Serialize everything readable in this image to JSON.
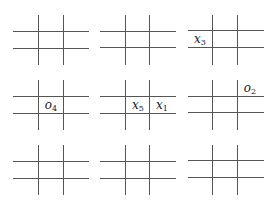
{
  "diagram": {
    "line_color": "#555555",
    "boards": [
      {
        "id": 1,
        "row": 0,
        "col": 0,
        "cells": [
          "",
          "",
          "",
          "",
          "",
          "",
          "",
          "",
          ""
        ]
      },
      {
        "id": 2,
        "row": 0,
        "col": 1,
        "cells": [
          "",
          "",
          "",
          "",
          "",
          "",
          "",
          "",
          ""
        ]
      },
      {
        "id": 3,
        "row": 0,
        "col": 2,
        "cells": [
          "",
          "",
          "",
          "x3",
          "",
          "",
          "",
          "",
          ""
        ]
      },
      {
        "id": 4,
        "row": 1,
        "col": 0,
        "cells": [
          "",
          "",
          "",
          "",
          "o4",
          "",
          "",
          "",
          ""
        ]
      },
      {
        "id": 5,
        "row": 1,
        "col": 1,
        "cells": [
          "",
          "",
          "",
          "",
          "x5",
          "x1",
          "",
          "",
          ""
        ]
      },
      {
        "id": 6,
        "row": 1,
        "col": 2,
        "cells": [
          "",
          "",
          "o2",
          "",
          "",
          "",
          "",
          "",
          ""
        ]
      },
      {
        "id": 7,
        "row": 2,
        "col": 0,
        "cells": [
          "",
          "",
          "",
          "",
          "",
          "",
          "",
          "",
          ""
        ]
      },
      {
        "id": 8,
        "row": 2,
        "col": 1,
        "cells": [
          "",
          "",
          "",
          "",
          "",
          "",
          "",
          "",
          ""
        ]
      },
      {
        "id": 9,
        "row": 2,
        "col": 2,
        "cells": [
          "",
          "",
          "",
          "",
          "",
          "",
          "",
          "",
          ""
        ]
      }
    ],
    "labels": {
      "x3": {
        "base": "x",
        "sub": "3"
      },
      "o4": {
        "base": "o",
        "sub": "4"
      },
      "x5": {
        "base": "x",
        "sub": "5"
      },
      "x1": {
        "base": "x",
        "sub": "1"
      },
      "o2": {
        "base": "o",
        "sub": "2"
      }
    }
  }
}
